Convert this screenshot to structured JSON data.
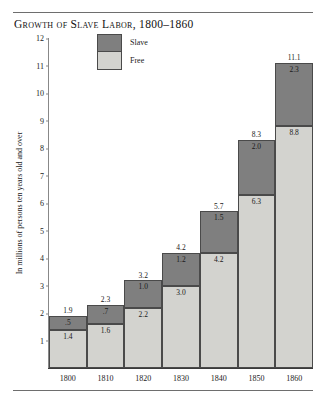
{
  "figure": {
    "title": "Growth of Slave Labor, 1800–1860"
  },
  "legend": {
    "position": "top-center-inside",
    "items": [
      {
        "label": "Slave",
        "color": "#7f7f7f"
      },
      {
        "label": "Free",
        "color": "#d3d3cf"
      }
    ]
  },
  "axes": {
    "ylabel": "In millions of persons ten years old and over",
    "yticks": [
      "12",
      "11",
      "10",
      "9",
      "8",
      "7",
      "6",
      "5",
      "4",
      "3",
      "2",
      "1"
    ],
    "xticks": [
      "1800",
      "1810",
      "1820",
      "1830",
      "1840",
      "1850",
      "1860"
    ]
  },
  "chart_data": {
    "type": "bar",
    "title": "Growth of Slave Labor, 1800–1860",
    "subtitle": "",
    "xlabel": "",
    "ylabel": "In millions of persons ten years old and over",
    "stacked": true,
    "grid": false,
    "legend_position": "top-center-inside",
    "ylim": [
      0,
      12
    ],
    "yticks": [
      1,
      2,
      3,
      4,
      5,
      6,
      7,
      8,
      9,
      10,
      11,
      12
    ],
    "categories": [
      "1800",
      "1810",
      "1820",
      "1830",
      "1840",
      "1850",
      "1860"
    ],
    "series": [
      {
        "name": "Free",
        "color": "#d3d3cf",
        "values": [
          1.4,
          1.6,
          2.2,
          3.0,
          4.2,
          6.3,
          8.8
        ],
        "labels": [
          "1.4",
          "1.6",
          "2.2",
          "3.0",
          "4.2",
          "6.3",
          "8.8"
        ]
      },
      {
        "name": "Slave",
        "color": "#7f7f7f",
        "values": [
          0.5,
          0.7,
          1.0,
          1.2,
          1.5,
          2.0,
          2.3
        ],
        "labels": [
          ".5",
          ".7",
          "1.0",
          "1.2",
          "1.5",
          "2.0",
          "2.3"
        ]
      }
    ],
    "totals": [
      1.9,
      2.3,
      3.2,
      4.2,
      5.7,
      8.3,
      11.1
    ],
    "total_labels": [
      "1.9",
      "2.3",
      "3.2",
      "4.2",
      "5.7",
      "8.3",
      "11.1"
    ]
  }
}
